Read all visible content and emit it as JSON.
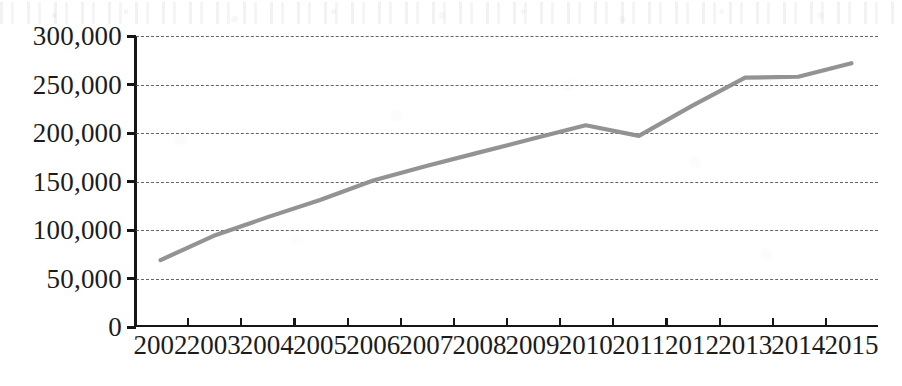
{
  "chart_data": {
    "type": "line",
    "title": "",
    "subtitle": "",
    "xlabel": "",
    "ylabel": "",
    "categories": [
      "2002",
      "2003",
      "2004",
      "2005",
      "2006",
      "2007",
      "2008",
      "2009",
      "2010",
      "2011",
      "2012",
      "2013",
      "2014",
      "2015"
    ],
    "series": [
      {
        "name": "",
        "color": "#8d8d8d",
        "values": [
          69000,
          94000,
          113000,
          131000,
          151000,
          166000,
          180000,
          194000,
          208000,
          197000,
          228000,
          257000,
          258000,
          272000
        ]
      }
    ],
    "ylim": [
      0,
      300000
    ],
    "y_ticks": [
      0,
      50000,
      100000,
      150000,
      200000,
      250000,
      300000
    ],
    "y_tick_labels": [
      "0",
      "50,000",
      "100,000",
      "150,000",
      "200,000",
      "250,000",
      "300,000"
    ],
    "x_tick_labels": [
      "2002",
      "2003",
      "2004",
      "2005",
      "2006",
      "2007",
      "2008",
      "2009",
      "2010",
      "2011",
      "2012",
      "2013",
      "2014",
      "2015"
    ],
    "grid": "horizontal-dashed",
    "legend": "none",
    "annotations": []
  },
  "style": {
    "line_color": "#8d8d8d",
    "axis_color": "#161616",
    "grid_color": "#4a4a4a",
    "background": "#ffffff",
    "text_color": "#1c1c1c"
  }
}
